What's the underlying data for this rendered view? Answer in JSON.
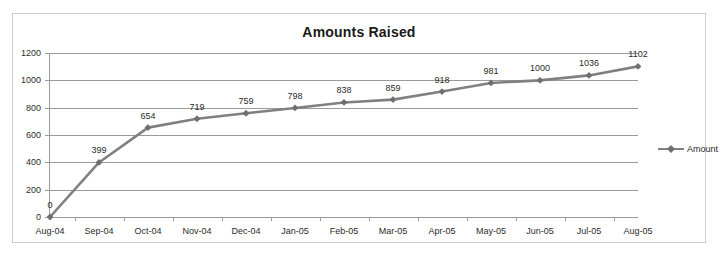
{
  "chart_data": {
    "type": "line",
    "title": "Amounts Raised",
    "xlabel": "",
    "ylabel": "",
    "categories": [
      "Aug-04",
      "Sep-04",
      "Oct-04",
      "Nov-04",
      "Dec-04",
      "Jan-05",
      "Feb-05",
      "Mar-05",
      "Apr-05",
      "May-05",
      "Jun-05",
      "Jul-05",
      "Aug-05"
    ],
    "series": [
      {
        "name": "Amount",
        "values": [
          0,
          399,
          654,
          719,
          759,
          798,
          838,
          859,
          918,
          981,
          1000,
          1036,
          1102
        ],
        "color": "#808080",
        "marker": "diamond"
      }
    ],
    "ylim": [
      0,
      1200
    ],
    "yticks": [
      0,
      200,
      400,
      600,
      800,
      1000,
      1200
    ],
    "ytick_labels": [
      "0",
      "200",
      "400",
      "600",
      "800",
      "1000",
      "1200"
    ],
    "grid": true,
    "data_labels": true,
    "legend_position": "right"
  },
  "legend": {
    "entries": [
      {
        "label": "Amount",
        "marker_icon": "diamond-marker-icon"
      }
    ]
  },
  "colors": {
    "series": "#808080",
    "gridline": "#9a9a9a",
    "axis": "#9a9a9a",
    "text": "#2b2b2b",
    "title": "#1a1a1a",
    "border": "#cccccc",
    "background": "#ffffff"
  }
}
